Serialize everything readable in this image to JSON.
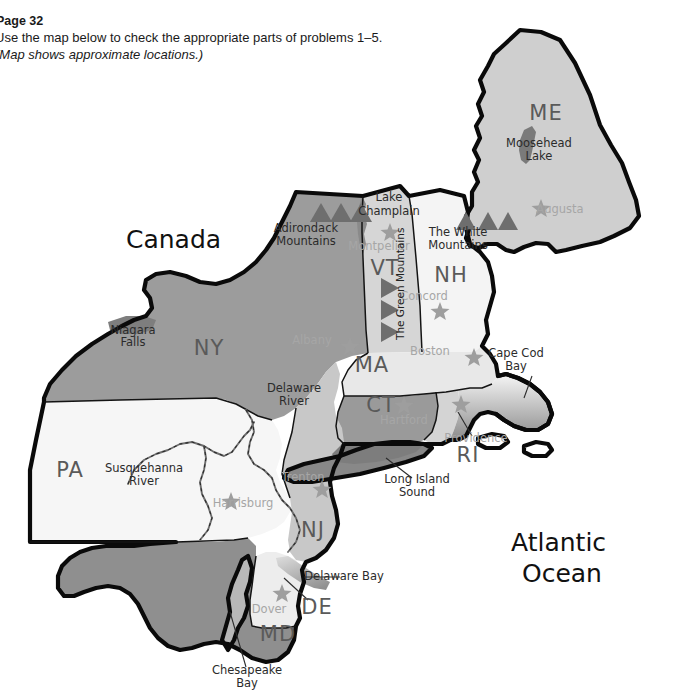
{
  "header": {
    "page_label": "Page 32",
    "instruction": "Use the map below to check the appropriate parts of problems 1–5.",
    "note": "(Map shows approximate locations.)"
  },
  "map": {
    "title": "Northeastern United States reference map",
    "region_labels": [
      {
        "name": "canada",
        "text": "Canada",
        "x": 126,
        "y": 248,
        "size": 25
      },
      {
        "name": "atlantic-ocean-line1",
        "text": "Atlantic",
        "x": 511,
        "y": 551,
        "size": 25
      },
      {
        "name": "atlantic-ocean-line2",
        "text": "Ocean",
        "x": 522,
        "y": 582,
        "size": 25
      }
    ],
    "states": [
      {
        "abbr": "ME",
        "name": "maine",
        "x": 546,
        "y": 120,
        "fill": "#cfcfcf"
      },
      {
        "abbr": "VT",
        "name": "vermont",
        "x": 385,
        "y": 275,
        "fill": "#d6d6d6"
      },
      {
        "abbr": "NH",
        "name": "new-hampshire",
        "x": 451,
        "y": 282,
        "fill": "#f2f2f2"
      },
      {
        "abbr": "NY",
        "name": "new-york",
        "x": 209,
        "y": 355,
        "fill": "#9c9c9c"
      },
      {
        "abbr": "MA",
        "name": "massachusetts",
        "x": 372,
        "y": 372,
        "fill": "#e6e6e6"
      },
      {
        "abbr": "CT",
        "name": "connecticut",
        "x": 381,
        "y": 412,
        "fill": "#9a9a9a"
      },
      {
        "abbr": "RI",
        "name": "rhode-island",
        "x": 468,
        "y": 462,
        "fill": "#d0d0d0"
      },
      {
        "abbr": "PA",
        "name": "pennsylvania",
        "x": 70,
        "y": 477,
        "fill": "#f4f4f4"
      },
      {
        "abbr": "NJ",
        "name": "new-jersey",
        "x": 313,
        "y": 537,
        "fill": "#c8c8c8"
      },
      {
        "abbr": "DE",
        "name": "delaware",
        "x": 317,
        "y": 614,
        "fill": "#ececec"
      },
      {
        "abbr": "MD",
        "name": "maryland",
        "x": 278,
        "y": 641,
        "fill": "#8f8f8f"
      }
    ],
    "cities": [
      {
        "name": "augusta",
        "label": "Augusta",
        "label_x": 560,
        "label_y": 213,
        "star_x": 541,
        "star_y": 209
      },
      {
        "name": "montpelier",
        "label": "Montpelier",
        "label_x": 379,
        "label_y": 250,
        "star_x": 390,
        "star_y": 233
      },
      {
        "name": "concord",
        "label": "Concord",
        "label_x": 424,
        "label_y": 300,
        "star_x": 440,
        "star_y": 312
      },
      {
        "name": "albany",
        "label": "Albany",
        "label_x": 312,
        "label_y": 344,
        "star_x": 350,
        "star_y": 347
      },
      {
        "name": "boston",
        "label": "Boston",
        "label_x": 430,
        "label_y": 355,
        "star_x": 474,
        "star_y": 358
      },
      {
        "name": "hartford",
        "label": "Hartford",
        "label_x": 404,
        "label_y": 424,
        "star_x": 404,
        "star_y": 406
      },
      {
        "name": "providence",
        "label": "Providence",
        "label_x": 476,
        "label_y": 442,
        "star_x": 461,
        "star_y": 405
      },
      {
        "name": "trenton",
        "label": "Trenton",
        "label_x": 303,
        "label_y": 481,
        "star_x": 322,
        "star_y": 490
      },
      {
        "name": "harrisburg",
        "label": "Harrisburg",
        "label_x": 243,
        "label_y": 507,
        "star_x": 231,
        "star_y": 502
      },
      {
        "name": "dover",
        "label": "Dover",
        "label_x": 269,
        "label_y": 613,
        "star_x": 282,
        "star_y": 594
      }
    ],
    "features": [
      {
        "name": "moosehead-lake-line1",
        "text": "Moosehead",
        "x": 539,
        "y": 147,
        "style": "feature"
      },
      {
        "name": "moosehead-lake-line2",
        "text": "Lake",
        "x": 539,
        "y": 160,
        "style": "feature"
      },
      {
        "name": "lake-champlain-line1",
        "text": "Lake",
        "x": 389,
        "y": 201,
        "style": "feature"
      },
      {
        "name": "lake-champlain-line2",
        "text": "Champlain",
        "x": 389,
        "y": 215,
        "style": "feature"
      },
      {
        "name": "adirondack-mountains-line1",
        "text": "Adirondack",
        "x": 306,
        "y": 232,
        "style": "feature"
      },
      {
        "name": "adirondack-mountains-line2",
        "text": "Mountains",
        "x": 306,
        "y": 245,
        "style": "feature"
      },
      {
        "name": "white-mountains-line1",
        "text": "The White",
        "x": 458,
        "y": 236,
        "style": "feature"
      },
      {
        "name": "white-mountains-line2",
        "text": "Mountains",
        "x": 458,
        "y": 249,
        "style": "feature"
      },
      {
        "name": "niagara-falls-line1",
        "text": "Niagara",
        "x": 133,
        "y": 334,
        "style": "feature"
      },
      {
        "name": "niagara-falls-line2",
        "text": "Falls",
        "x": 133,
        "y": 346,
        "style": "feature"
      },
      {
        "name": "delaware-river-line1",
        "text": "Delaware",
        "x": 294,
        "y": 392,
        "style": "feature"
      },
      {
        "name": "delaware-river-line2",
        "text": "River",
        "x": 294,
        "y": 405,
        "style": "feature"
      },
      {
        "name": "cape-cod-bay-line1",
        "text": "Cape Cod",
        "x": 516,
        "y": 357,
        "style": "feature"
      },
      {
        "name": "cape-cod-bay-line2",
        "text": "Bay",
        "x": 516,
        "y": 370,
        "style": "feature"
      },
      {
        "name": "susquehanna-river-line1",
        "text": "Susquehanna",
        "x": 144,
        "y": 472,
        "style": "feature"
      },
      {
        "name": "susquehanna-river-line2",
        "text": "River",
        "x": 144,
        "y": 485,
        "style": "feature"
      },
      {
        "name": "long-island-sound-line1",
        "text": "Long Island",
        "x": 417,
        "y": 483,
        "style": "feature"
      },
      {
        "name": "long-island-sound-line2",
        "text": "Sound",
        "x": 417,
        "y": 496,
        "style": "feature"
      },
      {
        "name": "delaware-bay",
        "text": "Delaware Bay",
        "x": 344,
        "y": 580,
        "style": "feature"
      },
      {
        "name": "chesapeake-bay-line1",
        "text": "Chesapeake",
        "x": 247,
        "y": 674,
        "style": "feature"
      },
      {
        "name": "chesapeake-bay-line2",
        "text": "Bay",
        "x": 247,
        "y": 687,
        "style": "feature"
      },
      {
        "name": "green-mountains",
        "text": "The Green Mountains",
        "x": 0,
        "y": 0,
        "style": "rotated"
      }
    ],
    "colors": {
      "outline": "#0a0a0a",
      "water": "#8c8c8c",
      "star": "#9e9e9e",
      "peak": "#6e6e6e",
      "city_text": "#a6a6a6",
      "state_text": "#5a5a5a"
    }
  }
}
